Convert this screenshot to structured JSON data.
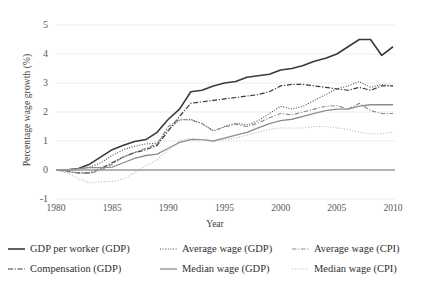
{
  "chart_data": {
    "type": "line",
    "title": "",
    "xlabel": "Year",
    "ylabel": "Percentage wage growth (%)",
    "xlim": [
      1980,
      2010
    ],
    "ylim": [
      -1,
      5
    ],
    "xticks": [
      1980,
      1985,
      1990,
      1995,
      2000,
      2005,
      2010
    ],
    "yticks": [
      -1,
      0,
      1,
      2,
      3,
      4,
      5
    ],
    "grid": "horizontal-light",
    "legend_position": "bottom",
    "zero_line": 0,
    "x": [
      1980,
      1981,
      1982,
      1983,
      1984,
      1985,
      1986,
      1987,
      1988,
      1989,
      1990,
      1991,
      1992,
      1993,
      1994,
      1995,
      1996,
      1997,
      1998,
      1999,
      2000,
      2001,
      2002,
      2003,
      2004,
      2005,
      2006,
      2007,
      2008,
      2009,
      2010
    ],
    "series": [
      {
        "name": "GDP per worker (GDP)",
        "style": "solid",
        "color": "#3a3a3a",
        "width": 1.6,
        "values": [
          0.0,
          0.0,
          0.05,
          0.2,
          0.45,
          0.7,
          0.85,
          0.98,
          1.05,
          1.3,
          1.75,
          2.1,
          2.7,
          2.75,
          2.9,
          3.0,
          3.05,
          3.2,
          3.25,
          3.3,
          3.45,
          3.5,
          3.6,
          3.75,
          3.85,
          4.0,
          4.25,
          4.5,
          4.5,
          3.95,
          4.25
        ]
      },
      {
        "name": "Compensation (GDP)",
        "style": "dashdot",
        "color": "#3a3a3a",
        "width": 1.2,
        "values": [
          0.0,
          -0.05,
          -0.1,
          -0.1,
          0.05,
          0.25,
          0.45,
          0.6,
          0.7,
          0.85,
          1.35,
          1.85,
          2.3,
          2.35,
          2.4,
          2.45,
          2.5,
          2.55,
          2.6,
          2.7,
          2.9,
          2.95,
          2.95,
          2.9,
          2.85,
          2.8,
          2.75,
          2.85,
          2.75,
          2.9,
          2.9
        ]
      },
      {
        "name": "Average wage (GDP)",
        "style": "dotted",
        "color": "#4a4a4a",
        "width": 1.1,
        "values": [
          0.0,
          0.02,
          0.05,
          0.1,
          0.25,
          0.5,
          0.7,
          0.82,
          0.9,
          0.92,
          1.4,
          1.72,
          1.75,
          1.6,
          1.35,
          1.5,
          1.62,
          1.55,
          1.7,
          1.95,
          2.2,
          2.1,
          2.2,
          2.4,
          2.6,
          2.8,
          2.9,
          3.05,
          2.85,
          2.95,
          2.9
        ]
      },
      {
        "name": "Average wage (CPI)",
        "style": "dashdot-light",
        "color": "#8a8a8a",
        "width": 1.1,
        "values": [
          0.0,
          -0.05,
          -0.1,
          -0.12,
          0.0,
          0.2,
          0.45,
          0.6,
          0.75,
          0.9,
          1.5,
          1.75,
          1.72,
          1.6,
          1.35,
          1.48,
          1.58,
          1.5,
          1.62,
          1.8,
          1.95,
          1.9,
          2.0,
          2.1,
          2.2,
          2.22,
          2.1,
          2.3,
          2.05,
          1.95,
          1.95
        ]
      },
      {
        "name": "Median wage (GDP)",
        "style": "solid-light",
        "color": "#8d8d8d",
        "width": 1.3,
        "values": [
          0.0,
          0.0,
          0.05,
          0.08,
          0.08,
          0.1,
          0.25,
          0.4,
          0.5,
          0.55,
          0.75,
          0.95,
          1.05,
          1.05,
          1.0,
          1.1,
          1.2,
          1.3,
          1.45,
          1.6,
          1.7,
          1.75,
          1.85,
          1.95,
          2.05,
          2.1,
          2.1,
          2.2,
          2.25,
          2.25,
          2.25
        ]
      },
      {
        "name": "Median wage (CPI)",
        "style": "dotted-light",
        "color": "#b4b4b4",
        "width": 1.1,
        "values": [
          0.0,
          -0.1,
          -0.3,
          -0.45,
          -0.4,
          -0.4,
          -0.3,
          -0.1,
          0.15,
          0.35,
          0.7,
          1.0,
          1.1,
          1.05,
          1.0,
          1.05,
          1.1,
          1.2,
          1.3,
          1.4,
          1.45,
          1.45,
          1.45,
          1.5,
          1.5,
          1.45,
          1.4,
          1.3,
          1.25,
          1.25,
          1.3
        ]
      }
    ]
  },
  "axes": {
    "y_title": "Percentage wage growth (%)",
    "x_title": "Year",
    "ytick_labels": [
      "5",
      "4",
      "3",
      "2",
      "1",
      "0",
      "-1"
    ],
    "xtick_labels": [
      "1980",
      "1985",
      "1990",
      "1995",
      "2000",
      "2005",
      "2010"
    ]
  },
  "legend": {
    "items": [
      {
        "label": "GDP per worker (GDP)"
      },
      {
        "label": "Average wage (GDP)"
      },
      {
        "label": "Average wage (CPI)"
      },
      {
        "label": "Compensation (GDP)"
      },
      {
        "label": "Median wage (GDP)"
      },
      {
        "label": "Median wage (CPI)"
      }
    ]
  }
}
